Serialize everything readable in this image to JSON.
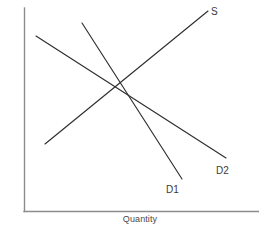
{
  "chart_data": {
    "type": "line",
    "title": "",
    "subtitle": "",
    "xlabel": "Quantity",
    "ylabel": "Price",
    "grid": false,
    "legend_position": "inline-end-of-curve",
    "axis_ranges": {
      "x": [
        0,
        100
      ],
      "y": [
        0,
        100
      ]
    },
    "axis_ticks": {
      "x": [],
      "y": []
    },
    "series": [
      {
        "name": "S",
        "label": "S",
        "role": "supply",
        "slope": "upward",
        "color": "#2e2e2e",
        "points": [
          {
            "x": 11,
            "y": 29
          },
          {
            "x": 89,
            "y": 92
          }
        ]
      },
      {
        "name": "D1",
        "label": "D1",
        "role": "demand-original",
        "slope": "downward",
        "color": "#2e2e2e",
        "points": [
          {
            "x": 31,
            "y": 90
          },
          {
            "x": 84,
            "y": 17
          }
        ]
      },
      {
        "name": "D2",
        "label": "D2",
        "role": "demand-shifted",
        "slope": "downward",
        "color": "#2e2e2e",
        "points": [
          {
            "x": 5,
            "y": 86
          },
          {
            "x": 85,
            "y": 26
          }
        ]
      }
    ],
    "annotations": [
      {
        "name": "equilibrium-d1",
        "x": 30,
        "y": 54,
        "label": ""
      },
      {
        "name": "equilibrium-d2",
        "x": 48,
        "y": 67,
        "label": ""
      }
    ],
    "labels": {
      "supply": "S",
      "demand_original": "D1",
      "demand_shifted": "D2"
    },
    "colors": {
      "curve": "#2e2e2e",
      "axis": "#8c8c8c",
      "label_text": "#4a4a4a",
      "curve_label_text": "#3a3a3a",
      "background": "#ffffff"
    }
  },
  "geometry": {
    "axes": {
      "y_axis": {
        "x1": 24,
        "y1": 8,
        "x2": 24,
        "y2": 211
      },
      "x_axis": {
        "x1": 24,
        "y1": 211,
        "x2": 259,
        "y2": 211
      }
    },
    "curves": {
      "supply": {
        "x1": 45,
        "y1": 144,
        "x2": 208,
        "y2": 11
      },
      "demand_original": {
        "x1": 82,
        "y1": 23,
        "x2": 182,
        "y2": 179
      },
      "demand_shifted": {
        "x1": 36,
        "y1": 36,
        "x2": 226,
        "y2": 158
      }
    },
    "intersections": {
      "s_x_d1": {
        "x": 95,
        "y": 102
      },
      "s_x_d2": {
        "x": 136,
        "y": 76
      }
    }
  }
}
